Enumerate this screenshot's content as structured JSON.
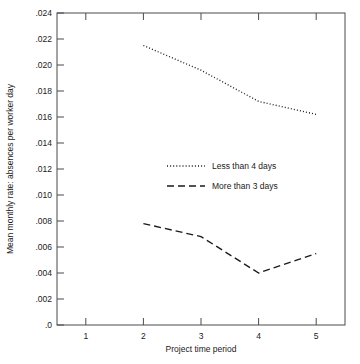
{
  "chart_data": {
    "type": "line",
    "title": "",
    "xlabel": "Project time period",
    "ylabel": "Mean monthly rate: absences per worker day",
    "x": [
      2,
      3,
      4,
      5
    ],
    "xlim": [
      0.5,
      5.5
    ],
    "ylim": [
      0.0,
      0.024
    ],
    "xticks": [
      "1",
      "2",
      "3",
      "4",
      "5"
    ],
    "xtick_values": [
      1,
      2,
      3,
      4,
      5
    ],
    "yticks": [
      ".0",
      ".002",
      ".004",
      ".006",
      ".008",
      ".010",
      ".012",
      ".014",
      ".016",
      ".018",
      ".020",
      ".022",
      ".024"
    ],
    "ytick_values": [
      0.0,
      0.002,
      0.004,
      0.006,
      0.008,
      0.01,
      0.012,
      0.014,
      0.016,
      0.018,
      0.02,
      0.022,
      0.024
    ],
    "grid": false,
    "legend_position": "center",
    "series": [
      {
        "name": "Less than 4 days",
        "style": "dotted",
        "values": [
          0.0215,
          0.0196,
          0.0172,
          0.0162
        ]
      },
      {
        "name": "More than 3 days",
        "style": "dashed",
        "values": [
          0.0078,
          0.0068,
          0.004,
          0.0055
        ]
      }
    ]
  },
  "legend": {
    "items": [
      {
        "label": "Less than 4 days",
        "style": "dotted"
      },
      {
        "label": "More than 3 days",
        "style": "dashed"
      }
    ]
  },
  "axes": {
    "x_title": "Project time period",
    "y_title": "Mean monthly rate: absences per worker day"
  }
}
